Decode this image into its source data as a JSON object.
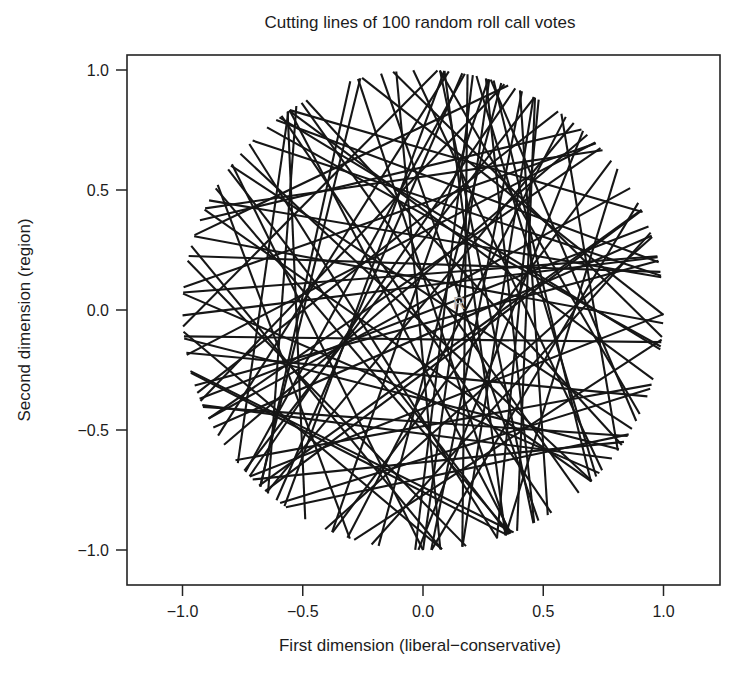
{
  "chart_data": {
    "type": "line",
    "title": "Cutting lines of 100 random roll call votes",
    "xlabel": "First dimension (liberal−conservative)",
    "ylabel": "Second dimension (region)",
    "xlim": [
      -1.231,
      1.235
    ],
    "ylim": [
      -1.146,
      1.062
    ],
    "xticks": [
      -1.0,
      -0.5,
      0.0,
      0.5,
      1.0
    ],
    "xticklabels": [
      "−1.0",
      "−0.5",
      "0.0",
      "0.5",
      "1.0"
    ],
    "yticks": [
      -1.0,
      -0.5,
      0.0,
      0.5,
      1.0
    ],
    "yticklabels": [
      "−1.0",
      "−0.5",
      "0.0",
      "0.5",
      "1.0"
    ],
    "grid": false,
    "legend": "none",
    "n_lines": 100,
    "line_color": "#161616",
    "annotations": [
      {
        "text": "R",
        "x": 0.15,
        "y": 0.03,
        "color": "#b3b3b3"
      }
    ],
    "series": [
      {
        "name": "cutting-lines",
        "type": "chords",
        "unit_circle_radius": 1.0,
        "chords": [
          {
            "angle": 0.0431,
            "offset": -0.5268
          },
          {
            "angle": 1.4021,
            "offset": 0.3011
          },
          {
            "angle": 2.664,
            "offset": -0.1574
          },
          {
            "angle": 0.7912,
            "offset": 0.6183
          },
          {
            "angle": 1.9455,
            "offset": -0.382
          },
          {
            "angle": 0.3188,
            "offset": 0.0452
          },
          {
            "angle": 2.9014,
            "offset": 0.4827
          },
          {
            "angle": 1.1073,
            "offset": -0.6602
          },
          {
            "angle": 2.2781,
            "offset": 0.1108
          },
          {
            "angle": 0.5604,
            "offset": -0.2439
          },
          {
            "angle": 1.7162,
            "offset": 0.5502
          },
          {
            "angle": 3.0211,
            "offset": -0.0881
          },
          {
            "angle": 0.934,
            "offset": 0.3367
          },
          {
            "angle": 2.4126,
            "offset": -0.4913
          },
          {
            "angle": 0.1657,
            "offset": 0.7024
          },
          {
            "angle": 1.5588,
            "offset": -0.122
          },
          {
            "angle": 2.7903,
            "offset": 0.2596
          },
          {
            "angle": 0.6891,
            "offset": -0.5739
          },
          {
            "angle": 2.0718,
            "offset": 0.0318
          },
          {
            "angle": 1.2507,
            "offset": 0.4471
          },
          {
            "angle": 2.9852,
            "offset": -0.3155
          },
          {
            "angle": 0.4023,
            "offset": 0.6348
          },
          {
            "angle": 1.834,
            "offset": -0.0563
          },
          {
            "angle": 2.5419,
            "offset": 0.2044
          },
          {
            "angle": 0.8705,
            "offset": -0.7113
          },
          {
            "angle": 1.6471,
            "offset": 0.1489
          },
          {
            "angle": 3.1004,
            "offset": -0.4288
          },
          {
            "angle": 0.2376,
            "offset": 0.5103
          },
          {
            "angle": 2.1967,
            "offset": -0.1938
          },
          {
            "angle": 1.0228,
            "offset": 0.3741
          },
          {
            "angle": 2.8457,
            "offset": -0.6021
          },
          {
            "angle": 0.617,
            "offset": 0.0876
          },
          {
            "angle": 1.4763,
            "offset": -0.2701
          },
          {
            "angle": 2.3605,
            "offset": 0.6601
          },
          {
            "angle": 0.0917,
            "offset": -0.0197
          },
          {
            "angle": 1.9074,
            "offset": 0.4186
          },
          {
            "angle": 2.6055,
            "offset": -0.5412
          },
          {
            "angle": 0.7403,
            "offset": 0.231
          },
          {
            "angle": 1.3209,
            "offset": -0.3604
          },
          {
            "angle": 3.0688,
            "offset": 0.5871
          },
          {
            "angle": 0.4812,
            "offset": -0.1066
          },
          {
            "angle": 2.2342,
            "offset": 0.3059
          },
          {
            "angle": 1.7805,
            "offset": -0.685
          },
          {
            "angle": 0.9888,
            "offset": 0.064
          },
          {
            "angle": 2.9467,
            "offset": -0.2272
          },
          {
            "angle": 0.2899,
            "offset": 0.4917
          },
          {
            "angle": 1.5021,
            "offset": -0.4655
          },
          {
            "angle": 2.4822,
            "offset": 0.1771
          },
          {
            "angle": 0.8201,
            "offset": -0.042
          },
          {
            "angle": 2.0166,
            "offset": 0.6912
          },
          {
            "angle": 1.163,
            "offset": -0.3331
          },
          {
            "angle": 2.7318,
            "offset": 0.243
          },
          {
            "angle": 0.357,
            "offset": -0.6178
          },
          {
            "angle": 1.693,
            "offset": 0.0995
          },
          {
            "angle": 3.1305,
            "offset": -0.1743
          },
          {
            "angle": 0.5261,
            "offset": 0.5614
          },
          {
            "angle": 2.3011,
            "offset": -0.4091
          },
          {
            "angle": 1.062,
            "offset": 0.3488
          },
          {
            "angle": 2.883,
            "offset": -0.0728
          },
          {
            "angle": 0.1302,
            "offset": 0.2178
          },
          {
            "angle": 1.8708,
            "offset": -0.593
          },
          {
            "angle": 2.578,
            "offset": 0.4405
          },
          {
            "angle": 0.654,
            "offset": -0.2863
          },
          {
            "angle": 1.387,
            "offset": 0.1283
          },
          {
            "angle": 2.149,
            "offset": -0.646
          },
          {
            "angle": 0.9032,
            "offset": 0.6029
          },
          {
            "angle": 3.002,
            "offset": -0.1392
          },
          {
            "angle": 0.4401,
            "offset": 0.3892
          },
          {
            "angle": 1.751,
            "offset": -0.4762
          },
          {
            "angle": 2.449,
            "offset": 0.0151
          },
          {
            "angle": 1.214,
            "offset": 0.529
          },
          {
            "angle": 2.768,
            "offset": -0.3472
          },
          {
            "angle": 0.2031,
            "offset": 0.2705
          },
          {
            "angle": 1.984,
            "offset": -0.0985
          },
          {
            "angle": 2.999,
            "offset": 0.6715
          },
          {
            "angle": 0.7721,
            "offset": -0.5583
          },
          {
            "angle": 1.537,
            "offset": 0.192
          },
          {
            "angle": 2.212,
            "offset": -0.2118
          },
          {
            "angle": 0.0652,
            "offset": 0.462
          },
          {
            "angle": 1.096,
            "offset": -0.674
          },
          {
            "angle": 2.639,
            "offset": 0.322
          },
          {
            "angle": 0.596,
            "offset": -0.033
          },
          {
            "angle": 1.805,
            "offset": 0.579
          },
          {
            "angle": 3.047,
            "offset": -0.396
          },
          {
            "angle": 0.338,
            "offset": 0.162
          },
          {
            "angle": 1.441,
            "offset": -0.512
          },
          {
            "angle": 2.378,
            "offset": 0.406
          },
          {
            "angle": 0.957,
            "offset": -0.181
          },
          {
            "angle": 2.051,
            "offset": 0.288
          },
          {
            "angle": 1.672,
            "offset": -0.631
          },
          {
            "angle": 2.81,
            "offset": 0.056
          },
          {
            "angle": 0.459,
            "offset": -0.443
          },
          {
            "angle": 1.289,
            "offset": 0.646
          },
          {
            "angle": 2.499,
            "offset": -0.254
          },
          {
            "angle": 0.108,
            "offset": 0.364
          },
          {
            "angle": 1.938,
            "offset": -0.012
          },
          {
            "angle": 2.924,
            "offset": 0.501
          },
          {
            "angle": 0.705,
            "offset": -0.328
          },
          {
            "angle": 2.176,
            "offset": 0.135
          }
        ]
      }
    ]
  },
  "figure": {
    "title": "Cutting lines of 100 random roll call votes",
    "xlabel": "First dimension (liberal−conservative)",
    "ylabel": "Second dimension (region)",
    "watermark": "R"
  }
}
